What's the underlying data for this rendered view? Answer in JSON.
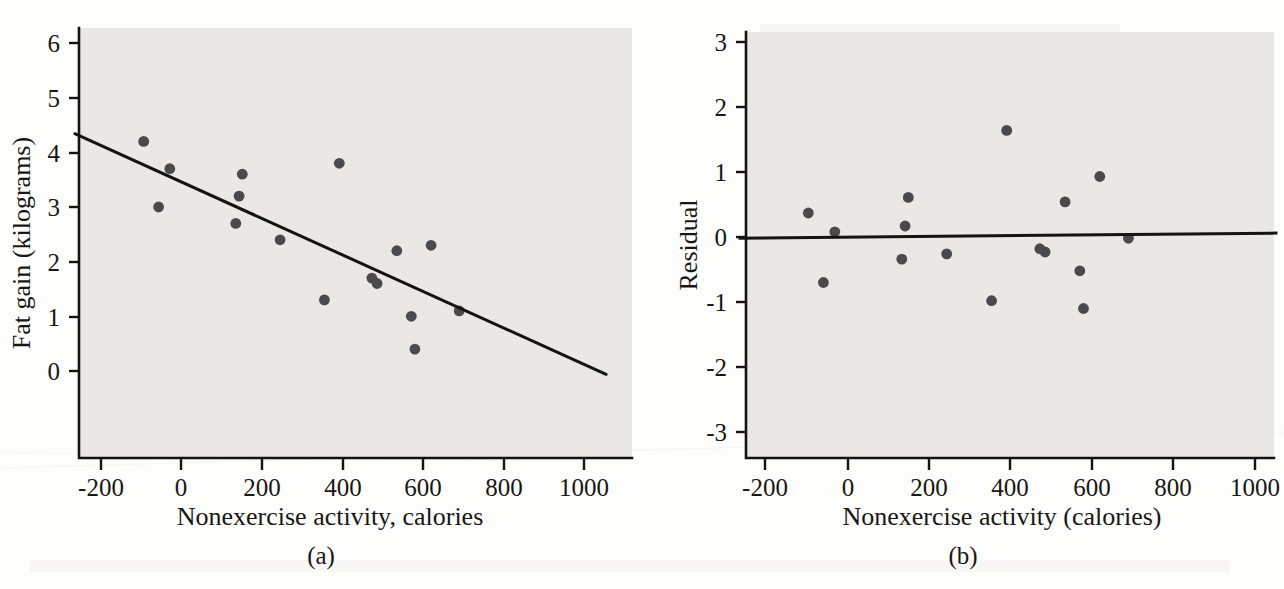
{
  "figure": {
    "panels": [
      {
        "key": "a",
        "caption": "(a)",
        "xlabel": "Nonexercise activity, calories",
        "ylabel": "Fat gain (kilograms)"
      },
      {
        "key": "b",
        "caption": "(b)",
        "xlabel": "Nonexercise activity (calories)",
        "ylabel": "Residual"
      }
    ],
    "colors": {
      "plot_background": "#e9e8e4",
      "axis": "#15130f",
      "point": "#4a4a4c",
      "line": "#15130f",
      "page_background": "#fdfdfc"
    }
  },
  "chart_data": [
    {
      "type": "scatter",
      "id": "panel-a",
      "title": "",
      "xlabel": "Nonexercise activity, calories",
      "ylabel": "Fat gain (kilograms)",
      "xlim": [
        -265,
        1055
      ],
      "ylim": [
        -0.75,
        6.45
      ],
      "xticks": [
        -200,
        0,
        200,
        400,
        600,
        800,
        1000
      ],
      "xticklabels": [
        "-200",
        "0",
        "200",
        "400",
        "600",
        "800",
        "1000"
      ],
      "yticks": [
        0,
        1,
        2,
        3,
        4,
        5,
        6
      ],
      "yticklabels": [
        "0",
        "1",
        "2",
        "3",
        "4",
        "5",
        "6"
      ],
      "grid": false,
      "legend": null,
      "x": [
        -94,
        -57,
        -29,
        135,
        143,
        151,
        245,
        355,
        392,
        473,
        486,
        535,
        571,
        580,
        620,
        690
      ],
      "y": [
        4.2,
        3.0,
        3.7,
        2.7,
        3.2,
        3.6,
        2.4,
        1.3,
        3.8,
        1.7,
        1.6,
        2.2,
        1.0,
        0.4,
        2.3,
        1.1
      ],
      "fit_line": {
        "label": "least-squares regression line",
        "slope": -0.00334,
        "intercept": 3.46,
        "x_start": -265,
        "x_end": 1055,
        "y_start": 4.34,
        "y_end": -0.06
      }
    },
    {
      "type": "scatter",
      "id": "panel-b",
      "title": "",
      "xlabel": "Nonexercise activity (calories)",
      "ylabel": "Residual",
      "xlim": [
        -265,
        1055
      ],
      "ylim": [
        -3.3,
        3.3
      ],
      "xticks": [
        -200,
        0,
        200,
        400,
        600,
        800,
        1000
      ],
      "xticklabels": [
        "-200",
        "0",
        "200",
        "400",
        "600",
        "800",
        "1000"
      ],
      "yticks": [
        -3,
        -2,
        -1,
        0,
        1,
        2,
        3
      ],
      "yticklabels": [
        "-3",
        "-2",
        "-1",
        "0",
        "1",
        "2",
        "3"
      ],
      "grid": false,
      "legend": null,
      "x": [
        -94,
        -57,
        -29,
        135,
        143,
        151,
        245,
        355,
        392,
        473,
        486,
        535,
        571,
        580,
        620,
        690
      ],
      "y": [
        0.37,
        -0.7,
        0.08,
        -0.34,
        0.17,
        0.61,
        -0.26,
        -0.98,
        1.64,
        -0.18,
        -0.23,
        0.54,
        -0.52,
        -1.1,
        0.93,
        -0.02
      ],
      "zero_line": {
        "label": "residual = 0 reference line",
        "value": 0.0,
        "y_left": -0.02,
        "y_right": 0.06
      }
    }
  ]
}
